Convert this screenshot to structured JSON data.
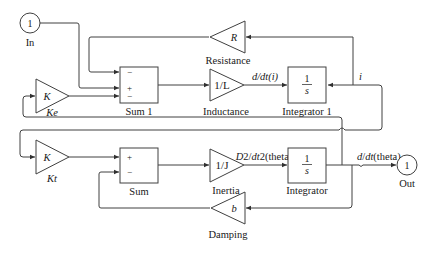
{
  "diagram": {
    "ports": {
      "in": {
        "number": "1",
        "label": "In"
      },
      "out": {
        "number": "1",
        "label": "Out"
      }
    },
    "blocks": {
      "sum1": {
        "label": "Sum 1",
        "signs": [
          "−",
          "+",
          "−"
        ]
      },
      "sum": {
        "label": "Sum",
        "signs": [
          "+",
          "−"
        ]
      },
      "resistance": {
        "label": "Resistance",
        "gain": "R"
      },
      "inductance": {
        "label": "Inductance",
        "gain": "1/L"
      },
      "integrator1": {
        "label": "Integrator 1",
        "numerator": "1",
        "denominator": "s"
      },
      "ke": {
        "label": "Ke",
        "gain": "K"
      },
      "kt": {
        "label": "Kt",
        "gain": "K"
      },
      "inertia": {
        "label": "Inertia",
        "gain": "1/J"
      },
      "integrator": {
        "label": "Integrator",
        "numerator": "1",
        "denominator": "s"
      },
      "damping": {
        "label": "Damping",
        "gain": "b"
      }
    },
    "signals": {
      "di_dt": "d/dt(i)",
      "i": "i",
      "d2theta": "D2/dt2(theta)",
      "dtheta": "d/dt(theta)"
    },
    "colors": {
      "line": "#404040",
      "text": "#202020",
      "background": "#ffffff"
    }
  }
}
